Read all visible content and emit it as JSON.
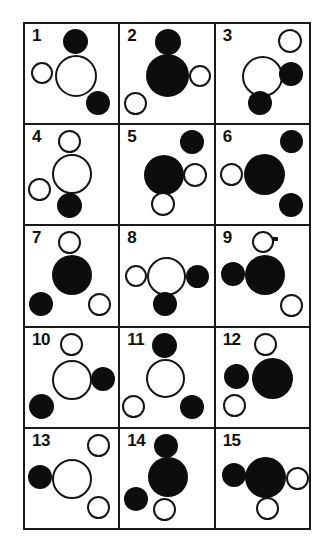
{
  "sheet": {
    "title": "Circle pattern grid",
    "columns": 3,
    "rows": 5,
    "cell_count": 15,
    "colors": {
      "filled_circle": "#0d0d0d",
      "open_circle_stroke": "#151515",
      "grid_line": "#1a1a1a",
      "background": "#ffffff",
      "number_text": "#111111"
    },
    "legend": {
      "filled": "filled",
      "open": "open"
    }
  },
  "cells": [
    {
      "number": "1",
      "circles": [
        {
          "role": "top-small-filled",
          "fill": "filled",
          "size": 25,
          "x": 38,
          "y": 5
        },
        {
          "role": "left-small-open",
          "fill": "open",
          "size": 22,
          "x": 6,
          "y": 38
        },
        {
          "role": "center-large-open",
          "fill": "open",
          "size": 42,
          "x": 30,
          "y": 31
        },
        {
          "role": "bottom-right-small-filled",
          "fill": "filled",
          "size": 24,
          "x": 61,
          "y": 67
        }
      ]
    },
    {
      "number": "2",
      "circles": [
        {
          "role": "top-small-filled",
          "fill": "filled",
          "size": 26,
          "x": 35,
          "y": 5
        },
        {
          "role": "center-large-filled",
          "fill": "filled",
          "size": 43,
          "x": 26,
          "y": 30
        },
        {
          "role": "right-small-open",
          "fill": "open",
          "size": 22,
          "x": 69,
          "y": 41
        },
        {
          "role": "bottom-left-small-open",
          "fill": "open",
          "size": 23,
          "x": 4,
          "y": 68
        }
      ]
    },
    {
      "number": "3",
      "circles": [
        {
          "role": "top-right-small-open",
          "fill": "open",
          "size": 24,
          "x": 62,
          "y": 5
        },
        {
          "role": "center-large-open",
          "fill": "open",
          "size": 41,
          "x": 26,
          "y": 32
        },
        {
          "role": "right-small-filled",
          "fill": "filled",
          "size": 24,
          "x": 63,
          "y": 38
        },
        {
          "role": "bottom-small-filled",
          "fill": "filled",
          "size": 24,
          "x": 32,
          "y": 67
        }
      ]
    },
    {
      "number": "4",
      "circles": [
        {
          "role": "top-small-open",
          "fill": "open",
          "size": 23,
          "x": 33,
          "y": 5
        },
        {
          "role": "center-large-open",
          "fill": "open",
          "size": 40,
          "x": 27,
          "y": 29
        },
        {
          "role": "left-small-open",
          "fill": "open",
          "size": 23,
          "x": 3,
          "y": 53
        },
        {
          "role": "bottom-small-filled",
          "fill": "filled",
          "size": 25,
          "x": 32,
          "y": 68
        }
      ]
    },
    {
      "number": "5",
      "circles": [
        {
          "role": "top-right-small-filled",
          "fill": "filled",
          "size": 24,
          "x": 60,
          "y": 5
        },
        {
          "role": "center-large-filled",
          "fill": "filled",
          "size": 40,
          "x": 24,
          "y": 30
        },
        {
          "role": "right-small-open",
          "fill": "open",
          "size": 24,
          "x": 63,
          "y": 38
        },
        {
          "role": "bottom-small-open",
          "fill": "open",
          "size": 24,
          "x": 31,
          "y": 67
        }
      ]
    },
    {
      "number": "6",
      "circles": [
        {
          "role": "top-right-small-filled",
          "fill": "filled",
          "size": 23,
          "x": 64,
          "y": 5
        },
        {
          "role": "left-small-open",
          "fill": "open",
          "size": 23,
          "x": 4,
          "y": 38
        },
        {
          "role": "center-large-filled",
          "fill": "filled",
          "size": 41,
          "x": 28,
          "y": 29
        },
        {
          "role": "bottom-right-small-filled",
          "fill": "filled",
          "size": 24,
          "x": 63,
          "y": 68
        }
      ]
    },
    {
      "number": "7",
      "circles": [
        {
          "role": "top-small-open",
          "fill": "open",
          "size": 23,
          "x": 33,
          "y": 5
        },
        {
          "role": "center-large-filled",
          "fill": "filled",
          "size": 40,
          "x": 27,
          "y": 29
        },
        {
          "role": "bottom-left-small-filled",
          "fill": "filled",
          "size": 24,
          "x": 4,
          "y": 66
        },
        {
          "role": "bottom-right-small-open",
          "fill": "open",
          "size": 23,
          "x": 63,
          "y": 67
        }
      ]
    },
    {
      "number": "8",
      "circles": [
        {
          "role": "left-small-open",
          "fill": "open",
          "size": 22,
          "x": 5,
          "y": 39
        },
        {
          "role": "center-large-open",
          "fill": "open",
          "size": 39,
          "x": 27,
          "y": 31
        },
        {
          "role": "right-small-filled",
          "fill": "filled",
          "size": 23,
          "x": 66,
          "y": 39
        },
        {
          "role": "bottom-small-filled",
          "fill": "filled",
          "size": 24,
          "x": 33,
          "y": 66
        }
      ]
    },
    {
      "number": "9",
      "circles": [
        {
          "role": "top-small-open-ticked",
          "fill": "open",
          "size": 22,
          "x": 36,
          "y": 5,
          "tick": true
        },
        {
          "role": "left-small-filled",
          "fill": "filled",
          "size": 24,
          "x": 5,
          "y": 36
        },
        {
          "role": "center-large-filled",
          "fill": "filled",
          "size": 40,
          "x": 29,
          "y": 29
        },
        {
          "role": "bottom-right-small-open",
          "fill": "open",
          "size": 23,
          "x": 64,
          "y": 68
        }
      ]
    },
    {
      "number": "10",
      "circles": [
        {
          "role": "top-small-open",
          "fill": "open",
          "size": 23,
          "x": 35,
          "y": 5
        },
        {
          "role": "center-large-open",
          "fill": "open",
          "size": 40,
          "x": 27,
          "y": 32
        },
        {
          "role": "right-small-filled",
          "fill": "filled",
          "size": 24,
          "x": 66,
          "y": 39
        },
        {
          "role": "bottom-left-small-filled",
          "fill": "filled",
          "size": 25,
          "x": 4,
          "y": 66
        }
      ]
    },
    {
      "number": "11",
      "circles": [
        {
          "role": "top-small-filled",
          "fill": "filled",
          "size": 25,
          "x": 32,
          "y": 5
        },
        {
          "role": "center-large-open",
          "fill": "open",
          "size": 39,
          "x": 26,
          "y": 31
        },
        {
          "role": "bottom-left-small-open",
          "fill": "open",
          "size": 23,
          "x": 2,
          "y": 67
        },
        {
          "role": "bottom-right-small-filled",
          "fill": "filled",
          "size": 24,
          "x": 60,
          "y": 67
        }
      ]
    },
    {
      "number": "12",
      "circles": [
        {
          "role": "top-small-open",
          "fill": "open",
          "size": 23,
          "x": 38,
          "y": 5
        },
        {
          "role": "left-small-filled",
          "fill": "filled",
          "size": 25,
          "x": 8,
          "y": 36
        },
        {
          "role": "center-large-filled",
          "fill": "filled",
          "size": 41,
          "x": 36,
          "y": 30
        },
        {
          "role": "bottom-left-small-open",
          "fill": "open",
          "size": 23,
          "x": 7,
          "y": 66
        }
      ]
    },
    {
      "number": "13",
      "circles": [
        {
          "role": "top-right-small-open",
          "fill": "open",
          "size": 23,
          "x": 62,
          "y": 5
        },
        {
          "role": "left-small-filled",
          "fill": "filled",
          "size": 24,
          "x": 3,
          "y": 36
        },
        {
          "role": "center-large-open",
          "fill": "open",
          "size": 40,
          "x": 27,
          "y": 30
        },
        {
          "role": "bottom-right-small-open",
          "fill": "open",
          "size": 23,
          "x": 62,
          "y": 67
        }
      ]
    },
    {
      "number": "14",
      "circles": [
        {
          "role": "top-small-filled",
          "fill": "filled",
          "size": 24,
          "x": 34,
          "y": 5
        },
        {
          "role": "center-large-filled",
          "fill": "filled",
          "size": 40,
          "x": 28,
          "y": 28
        },
        {
          "role": "left-small-filled",
          "fill": "filled",
          "size": 24,
          "x": 4,
          "y": 58
        },
        {
          "role": "bottom-small-open",
          "fill": "open",
          "size": 23,
          "x": 33,
          "y": 69
        }
      ]
    },
    {
      "number": "15",
      "circles": [
        {
          "role": "left-small-filled",
          "fill": "filled",
          "size": 24,
          "x": 6,
          "y": 34
        },
        {
          "role": "center-large-filled",
          "fill": "filled",
          "size": 41,
          "x": 29,
          "y": 28
        },
        {
          "role": "right-small-open",
          "fill": "open",
          "size": 23,
          "x": 70,
          "y": 38
        },
        {
          "role": "bottom-small-open",
          "fill": "open",
          "size": 23,
          "x": 40,
          "y": 68
        }
      ]
    }
  ]
}
